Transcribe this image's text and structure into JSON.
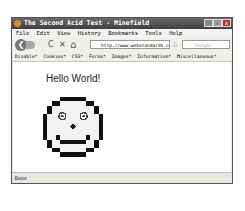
{
  "window": {
    "title": "The Second Acid Test - Minefield",
    "controls": [
      "minimize",
      "maximize",
      "close"
    ]
  },
  "menubar": {
    "items": [
      "File",
      "Edit",
      "View",
      "History",
      "Bookmarks",
      "Tools",
      "Help"
    ]
  },
  "navbar": {
    "url": "http://www.webstandards.org/fi",
    "search_placeholder": "Google",
    "icons": {
      "back": "❮",
      "reload": "C",
      "stop": "✕",
      "home": "⌂",
      "star": "☆"
    }
  },
  "devbar": {
    "items": [
      "Disable*",
      "Cookies*",
      "CSS*",
      "Forms*",
      "Images*",
      "Information*",
      "Miscellaneous*"
    ]
  },
  "page": {
    "heading": "Hello World!"
  },
  "status": {
    "text": "Done"
  },
  "colors": {
    "titlebar": "#4a4a4a",
    "face": "#111111"
  }
}
